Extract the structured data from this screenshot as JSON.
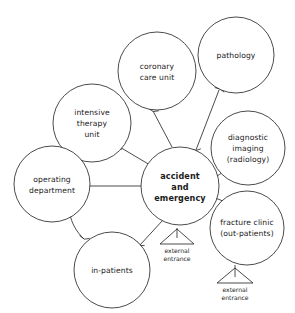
{
  "diagram": {
    "stroke_color": "#2b2b2b",
    "background_color": "#ffffff",
    "nodes": [
      {
        "id": "coronary-care-unit",
        "lines": [
          "coronary",
          "care unit"
        ],
        "cx": 157,
        "cy": 71,
        "r": 39
      },
      {
        "id": "pathology",
        "lines": [
          "pathology"
        ],
        "cx": 236,
        "cy": 55,
        "r": 38
      },
      {
        "id": "intensive-therapy-unit",
        "lines": [
          "intensive",
          "therapy",
          "unit"
        ],
        "cx": 92,
        "cy": 123,
        "r": 39
      },
      {
        "id": "diagnostic-imaging",
        "lines": [
          "diagnostic",
          "imaging",
          "(radiology)"
        ],
        "cx": 248,
        "cy": 148,
        "r": 37
      },
      {
        "id": "operating-department",
        "lines": [
          "operating",
          "department"
        ],
        "cx": 52,
        "cy": 184,
        "r": 38
      },
      {
        "id": "accident-and-emergency",
        "lines": [
          "accident",
          "and",
          "emergency"
        ],
        "cx": 180,
        "cy": 186,
        "r": 39,
        "bold": true
      },
      {
        "id": "fracture-clinic",
        "lines": [
          "fracture clinic",
          "(out-patients)"
        ],
        "cx": 247,
        "cy": 228,
        "r": 37
      },
      {
        "id": "in-patients",
        "lines": [
          "in-patients"
        ],
        "cx": 112,
        "cy": 270,
        "r": 38
      }
    ],
    "entrances": [
      {
        "id": "external-entrance-centre",
        "lines": [
          "external",
          "entrance"
        ],
        "x": 177,
        "y": 240
      },
      {
        "id": "external-entrance-fracture",
        "lines": [
          "external",
          "entrance"
        ],
        "x": 235,
        "y": 280
      }
    ],
    "edges": [
      {
        "from": "accident-and-emergency",
        "to": "coronary-care-unit",
        "direction": "one-way"
      },
      {
        "from": "accident-and-emergency",
        "to": "pathology",
        "direction": "two-way"
      },
      {
        "from": "accident-and-emergency",
        "to": "intensive-therapy-unit",
        "direction": "one-way"
      },
      {
        "from": "accident-and-emergency",
        "to": "diagnostic-imaging",
        "direction": "two-way"
      },
      {
        "from": "accident-and-emergency",
        "to": "fracture-clinic",
        "direction": "two-way"
      },
      {
        "from": "accident-and-emergency",
        "to": "operating-department",
        "direction": "one-way"
      },
      {
        "from": "accident-and-emergency",
        "to": "in-patients",
        "direction": "one-way"
      },
      {
        "from": "operating-department",
        "to": "intensive-therapy-unit",
        "direction": "one-way"
      },
      {
        "from": "operating-department",
        "to": "in-patients",
        "direction": "one-way"
      },
      {
        "from": "external-entrance-centre",
        "to": "accident-and-emergency",
        "direction": "one-way"
      },
      {
        "from": "external-entrance-fracture",
        "to": "fracture-clinic",
        "direction": "one-way"
      }
    ]
  }
}
